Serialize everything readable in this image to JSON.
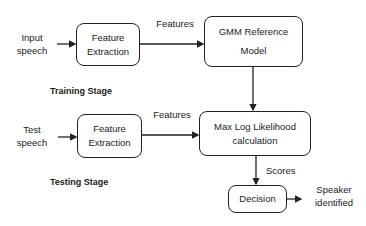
{
  "diagram": {
    "training": {
      "input_label_line1": "Input",
      "input_label_line2": "speech",
      "feature_box_line1": "Feature",
      "feature_box_line2": "Extraction",
      "edge_label": "Features",
      "model_box_line1": "GMM Reference",
      "model_box_line2": "Model",
      "stage_label": "Training Stage"
    },
    "testing": {
      "input_label_line1": "Test",
      "input_label_line2": "speech",
      "feature_box_line1": "Feature",
      "feature_box_line2": "Extraction",
      "edge_label": "Features",
      "likelihood_box_line1": "Max Log Likelihood",
      "likelihood_box_line2": "calculation",
      "stage_label": "Testing Stage"
    },
    "scores_label": "Scores",
    "decision_box": "Decision",
    "output_label_line1": "Speaker",
    "output_label_line2": "identified"
  }
}
